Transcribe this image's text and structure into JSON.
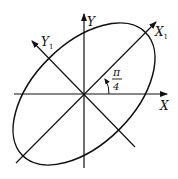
{
  "diagram": {
    "type": "rotated-axes-ellipse",
    "labels": {
      "x_axis": "X",
      "y_axis": "Y",
      "x1_axis": "X",
      "x1_sub": "1",
      "y1_axis": "Y",
      "y1_sub": "1",
      "angle_num": "π",
      "angle_den": "4"
    },
    "angle": "π/4",
    "colors": {
      "stroke": "#111111",
      "background": "#ffffff"
    }
  }
}
